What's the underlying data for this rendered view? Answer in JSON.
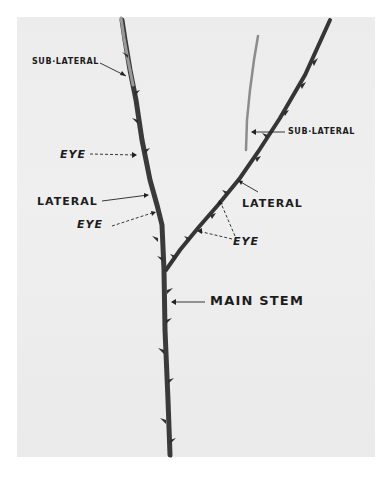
{
  "figure": {
    "background_color": "#ececec",
    "stem_color": "#3a3a3a",
    "labels": [
      {
        "id": "sub-lateral-left",
        "text": "SUB·LATERAL"
      },
      {
        "id": "eye-upper-left",
        "text": "EYE"
      },
      {
        "id": "lateral-left",
        "text": "LATERAL"
      },
      {
        "id": "eye-lower-left",
        "text": "EYE"
      },
      {
        "id": "sub-lateral-right",
        "text": "SUB·LATERAL"
      },
      {
        "id": "lateral-right",
        "text": "LATERAL"
      },
      {
        "id": "eye-right",
        "text": "EYE"
      },
      {
        "id": "main-stem",
        "text": "MAIN STEM"
      }
    ]
  }
}
